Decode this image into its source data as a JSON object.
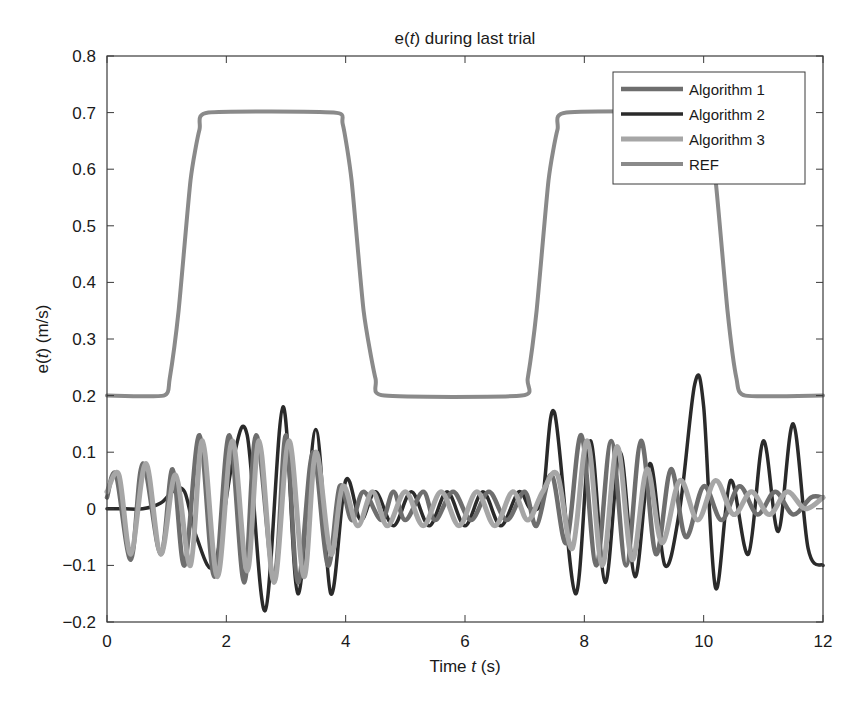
{
  "chart_data": {
    "type": "line",
    "title": "e(t) during last trial",
    "title_parts": {
      "pre": "e(",
      "italic": "t",
      "post": ") during last trial"
    },
    "xlabel": "Time t (s)",
    "xlabel_parts": {
      "pre": "Time ",
      "italic": "t",
      "post": " (s)"
    },
    "ylabel": "e(t) (m/s)",
    "ylabel_parts": {
      "pre": "e(",
      "italic": "t",
      "post": ") (m/s)"
    },
    "xlim": [
      0,
      12
    ],
    "ylim": [
      -0.2,
      0.8
    ],
    "xticks": [
      0,
      2,
      4,
      6,
      8,
      10,
      12
    ],
    "xtick_labels": [
      "0",
      "2",
      "4",
      "6",
      "8",
      "10",
      "12"
    ],
    "yticks": [
      -0.2,
      -0.1,
      0,
      0.1,
      0.2,
      0.3,
      0.4,
      0.5,
      0.6,
      0.7,
      0.8
    ],
    "ytick_labels": [
      "−0.2",
      "−0.1",
      "0",
      "0.1",
      "0.2",
      "0.3",
      "0.4",
      "0.5",
      "0.6",
      "0.7",
      "0.8"
    ],
    "grid": false,
    "legend_position": "top-right",
    "series": [
      {
        "name": "Algorithm 1",
        "color": "#6e6e6e",
        "x": [
          0,
          0.15,
          0.4,
          0.6,
          0.9,
          1.1,
          1.3,
          1.55,
          1.8,
          2.05,
          2.3,
          2.5,
          2.8,
          3.0,
          3.2,
          3.45,
          3.7,
          3.9,
          4.1,
          4.3,
          4.6,
          4.8,
          5.0,
          5.3,
          5.5,
          5.8,
          6.1,
          6.4,
          6.7,
          7.0,
          7.2,
          7.45,
          7.7,
          7.95,
          8.2,
          8.45,
          8.7,
          8.95,
          9.2,
          9.45,
          9.7,
          10.0,
          10.3,
          10.6,
          10.9,
          11.2,
          11.5,
          11.8,
          12.0
        ],
        "y": [
          0.02,
          0.06,
          -0.09,
          0.08,
          -0.08,
          0.07,
          -0.1,
          0.13,
          -0.12,
          0.13,
          -0.13,
          0.13,
          -0.12,
          0.13,
          -0.13,
          0.1,
          -0.1,
          0.04,
          -0.02,
          0.03,
          -0.02,
          0.03,
          -0.02,
          0.03,
          -0.02,
          0.03,
          -0.02,
          0.03,
          -0.02,
          0.03,
          -0.03,
          0.06,
          -0.06,
          0.13,
          -0.1,
          0.12,
          -0.1,
          0.12,
          -0.08,
          0.07,
          -0.05,
          0.04,
          -0.02,
          0.04,
          -0.01,
          0.03,
          -0.01,
          0.02,
          0.02
        ]
      },
      {
        "name": "Algorithm 2",
        "color": "#2a2a2a",
        "x": [
          0,
          0.3,
          0.6,
          0.9,
          1.1,
          1.3,
          1.5,
          1.8,
          2.1,
          2.35,
          2.65,
          2.95,
          3.2,
          3.5,
          3.75,
          4.0,
          4.25,
          4.5,
          4.8,
          5.1,
          5.4,
          5.7,
          6.0,
          6.3,
          6.6,
          6.9,
          7.1,
          7.3,
          7.5,
          7.85,
          8.1,
          8.35,
          8.6,
          8.85,
          9.1,
          9.35,
          9.6,
          9.85,
          10.0,
          10.2,
          10.45,
          10.75,
          11.0,
          11.25,
          11.5,
          11.75,
          12.0
        ],
        "y": [
          0,
          0,
          0,
          0.01,
          0.03,
          0.03,
          -0.05,
          -0.1,
          0.08,
          0.13,
          -0.18,
          0.18,
          -0.15,
          0.14,
          -0.15,
          0.05,
          -0.02,
          0.03,
          -0.03,
          0.03,
          -0.03,
          0.03,
          -0.03,
          0.03,
          -0.03,
          0.03,
          0.0,
          0.02,
          0.17,
          -0.15,
          0.12,
          -0.13,
          0.1,
          -0.12,
          0.08,
          -0.1,
          0.0,
          0.22,
          0.18,
          -0.14,
          0.05,
          -0.08,
          0.12,
          -0.04,
          0.15,
          -0.07,
          -0.1
        ]
      },
      {
        "name": "Algorithm 3",
        "color": "#a6a6a6",
        "x": [
          0,
          0.2,
          0.4,
          0.65,
          0.9,
          1.15,
          1.4,
          1.6,
          1.85,
          2.1,
          2.35,
          2.55,
          2.8,
          3.05,
          3.3,
          3.5,
          3.75,
          3.95,
          4.2,
          4.45,
          4.7,
          5.0,
          5.3,
          5.6,
          5.9,
          6.2,
          6.5,
          6.8,
          7.05,
          7.3,
          7.55,
          7.8,
          8.05,
          8.3,
          8.55,
          8.8,
          9.05,
          9.3,
          9.6,
          9.9,
          10.2,
          10.5,
          10.8,
          11.1,
          11.4,
          11.7,
          12.0
        ],
        "y": [
          0.03,
          0.06,
          -0.08,
          0.08,
          -0.08,
          0.06,
          -0.1,
          0.12,
          -0.12,
          0.12,
          -0.11,
          0.12,
          -0.13,
          0.12,
          -0.12,
          0.1,
          -0.08,
          0.04,
          -0.03,
          0.03,
          -0.03,
          0.03,
          -0.03,
          0.03,
          -0.03,
          0.03,
          -0.03,
          0.03,
          -0.02,
          0.03,
          0.06,
          -0.07,
          0.12,
          -0.1,
          0.11,
          -0.09,
          0.07,
          -0.06,
          0.05,
          -0.02,
          0.05,
          -0.01,
          0.03,
          -0.01,
          0.03,
          0.0,
          0.02
        ]
      },
      {
        "name": "REF",
        "color": "#8a8a8a",
        "x": [
          0,
          0.95,
          1.05,
          1.2,
          1.4,
          1.55,
          1.7,
          3.8,
          3.95,
          4.1,
          4.3,
          4.5,
          4.65,
          6.95,
          7.05,
          7.2,
          7.4,
          7.55,
          7.7,
          9.95,
          10.05,
          10.2,
          10.4,
          10.55,
          10.7,
          12.0
        ],
        "y": [
          0.2,
          0.2,
          0.23,
          0.35,
          0.58,
          0.67,
          0.7,
          0.7,
          0.68,
          0.58,
          0.35,
          0.23,
          0.2,
          0.2,
          0.23,
          0.35,
          0.58,
          0.67,
          0.7,
          0.7,
          0.67,
          0.58,
          0.35,
          0.23,
          0.2,
          0.2
        ]
      }
    ]
  }
}
